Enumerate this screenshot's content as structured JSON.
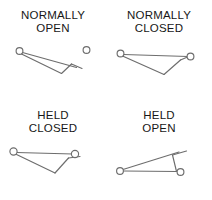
{
  "diagram": {
    "background_color": "#ffffff",
    "line_color": "#6d6d6d",
    "text_color": "#171717",
    "symbols": [
      {
        "id": "normally-open",
        "label": "NORMALLY\nOPEN",
        "label_line1": "NORMALLY",
        "label_line2": "OPEN",
        "state": "open",
        "description": "Pivot terminal at left with lever arm angled downward to the right; separate right-hand contact terminal is not touched by the lever."
      },
      {
        "id": "normally-closed",
        "label": "NORMALLY\nCLOSED",
        "label_line1": "NORMALLY",
        "label_line2": "CLOSED",
        "state": "closed",
        "description": "Pivot terminal at left with lever arm resting against the right-hand contact terminal."
      },
      {
        "id": "held-closed",
        "label": "HELD\nCLOSED",
        "label_line1": "HELD",
        "label_line2": "CLOSED",
        "state": "closed",
        "description": "Normally open contact shown actuated: lever arm is pressed down onto the right-hand contact terminal."
      },
      {
        "id": "held-open",
        "label": "HELD\nOPEN",
        "label_line1": "HELD",
        "label_line2": "OPEN",
        "state": "open",
        "description": "Normally closed contact shown actuated: lever arm is lifted up and away from the right-hand contact terminal."
      }
    ]
  }
}
